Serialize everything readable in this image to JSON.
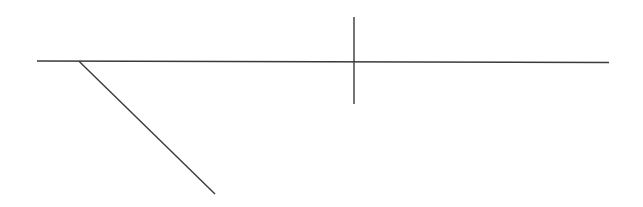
{
  "diagram": {
    "width": 643,
    "height": 207,
    "background": "#ffffff",
    "stroke_color": "#3a3a3a",
    "stroke_width": 1.4,
    "lines": [
      {
        "id": "horizontal-line",
        "x1": 37,
        "y1": 61,
        "x2": 609,
        "y2": 62.5
      },
      {
        "id": "vertical-line",
        "x1": 354,
        "y1": 17,
        "x2": 354,
        "y2": 104
      },
      {
        "id": "diagonal-line",
        "x1": 79,
        "y1": 61.2,
        "x2": 215,
        "y2": 194
      }
    ]
  }
}
